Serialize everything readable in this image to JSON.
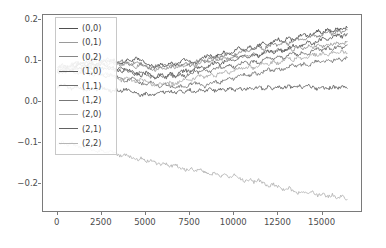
{
  "figure": {
    "background": "#ffffff",
    "axes_edge_color": "#7a7a7a",
    "tick_label_color": "#4d4d4d"
  },
  "legend": {
    "position": "upper left",
    "frame": true,
    "entries": [
      {
        "label": "(0,0)",
        "color": "#4f4f4f"
      },
      {
        "label": "(0,1)",
        "color": "#9a9a9a"
      },
      {
        "label": "(0,2)",
        "color": "#868686"
      },
      {
        "label": "(1,0)",
        "color": "#5a5a5a"
      },
      {
        "label": "(1,1)",
        "color": "#6e6e6e"
      },
      {
        "label": "(1,2)",
        "color": "#777777"
      },
      {
        "label": "(2,0)",
        "color": "#aeaeae"
      },
      {
        "label": "(2,1)",
        "color": "#626262"
      },
      {
        "label": "(2,2)",
        "color": "#b6b6b6"
      }
    ]
  },
  "chart_data": {
    "type": "line",
    "title": "",
    "xlabel": "",
    "ylabel": "",
    "grid": false,
    "legend_position": "upper left",
    "xlim": [
      -830,
      17290
    ],
    "ylim": [
      -0.272,
      0.212
    ],
    "xticks": [
      0,
      2500,
      5000,
      7500,
      10000,
      12500,
      15000
    ],
    "xtick_labels": [
      "0",
      "2500",
      "5000",
      "7500",
      "10000",
      "12500",
      "15000"
    ],
    "yticks": [
      0.2,
      0.1,
      0.0,
      -0.1,
      -0.2
    ],
    "ytick_labels": [
      "0.2",
      "0.1",
      "0.0",
      "-0.1",
      "-0.2"
    ],
    "x_start": 0,
    "x_end": 16500,
    "n_points": 60,
    "series": [
      {
        "name": "(0,0)",
        "color": "#4f4f4f",
        "values": [
          0.071,
          0.078,
          0.082,
          0.075,
          0.088,
          0.093,
          0.086,
          0.095,
          0.091,
          0.099,
          0.094,
          0.103,
          0.098,
          0.092,
          0.101,
          0.096,
          0.105,
          0.099,
          0.094,
          0.088,
          0.083,
          0.091,
          0.086,
          0.094,
          0.089,
          0.097,
          0.103,
          0.097,
          0.092,
          0.1,
          0.108,
          0.113,
          0.107,
          0.115,
          0.121,
          0.116,
          0.124,
          0.131,
          0.126,
          0.134,
          0.129,
          0.137,
          0.143,
          0.138,
          0.146,
          0.152,
          0.147,
          0.155,
          0.15,
          0.158,
          0.164,
          0.159,
          0.167,
          0.173,
          0.168,
          0.176,
          0.171,
          0.179,
          0.175,
          0.181
        ]
      },
      {
        "name": "(0,1)",
        "color": "#9a9a9a",
        "values": [
          0.074,
          0.069,
          0.078,
          0.084,
          0.079,
          0.087,
          0.082,
          0.09,
          0.085,
          0.093,
          0.088,
          0.096,
          0.091,
          0.086,
          0.094,
          0.089,
          0.083,
          0.091,
          0.086,
          0.08,
          0.075,
          0.083,
          0.078,
          0.086,
          0.081,
          0.089,
          0.084,
          0.092,
          0.087,
          0.095,
          0.101,
          0.096,
          0.104,
          0.099,
          0.107,
          0.102,
          0.11,
          0.105,
          0.113,
          0.108,
          0.116,
          0.111,
          0.119,
          0.124,
          0.119,
          0.127,
          0.122,
          0.13,
          0.125,
          0.133,
          0.128,
          0.136,
          0.131,
          0.139,
          0.134,
          0.142,
          0.137,
          0.145,
          0.14,
          0.147
        ]
      },
      {
        "name": "(0,2)",
        "color": "#868686",
        "values": [
          0.082,
          0.089,
          0.084,
          0.092,
          0.097,
          0.091,
          0.099,
          0.094,
          0.102,
          0.096,
          0.104,
          0.098,
          0.093,
          0.101,
          0.095,
          0.089,
          0.097,
          0.091,
          0.085,
          0.079,
          0.087,
          0.081,
          0.089,
          0.083,
          0.091,
          0.085,
          0.093,
          0.087,
          0.095,
          0.102,
          0.096,
          0.104,
          0.11,
          0.105,
          0.113,
          0.118,
          0.112,
          0.12,
          0.126,
          0.121,
          0.129,
          0.134,
          0.128,
          0.136,
          0.142,
          0.137,
          0.145,
          0.14,
          0.148,
          0.154,
          0.149,
          0.157,
          0.162,
          0.157,
          0.165,
          0.17,
          0.165,
          0.173,
          0.168,
          0.176
        ]
      },
      {
        "name": "(1,0)",
        "color": "#5a5a5a",
        "values": [
          0.068,
          0.075,
          0.07,
          0.078,
          0.083,
          0.077,
          0.085,
          0.08,
          0.088,
          0.082,
          0.076,
          0.084,
          0.078,
          0.072,
          0.08,
          0.074,
          0.068,
          0.062,
          0.07,
          0.064,
          0.058,
          0.066,
          0.06,
          0.068,
          0.062,
          0.07,
          0.076,
          0.071,
          0.079,
          0.085,
          0.08,
          0.088,
          0.094,
          0.089,
          0.097,
          0.103,
          0.098,
          0.106,
          0.112,
          0.107,
          0.115,
          0.11,
          0.118,
          0.124,
          0.119,
          0.127,
          0.122,
          0.13,
          0.136,
          0.131,
          0.139,
          0.145,
          0.14,
          0.148,
          0.154,
          0.149,
          0.157,
          0.163,
          0.158,
          0.166
        ]
      },
      {
        "name": "(1,1)",
        "color": "#6e6e6e",
        "values": [
          0.08,
          0.086,
          0.081,
          0.089,
          0.094,
          0.088,
          0.096,
          0.09,
          0.084,
          0.092,
          0.086,
          0.08,
          0.074,
          0.082,
          0.076,
          0.07,
          0.064,
          0.072,
          0.066,
          0.06,
          0.054,
          0.062,
          0.056,
          0.064,
          0.058,
          0.066,
          0.06,
          0.068,
          0.074,
          0.069,
          0.077,
          0.071,
          0.079,
          0.085,
          0.08,
          0.088,
          0.082,
          0.09,
          0.096,
          0.091,
          0.099,
          0.093,
          0.101,
          0.107,
          0.102,
          0.11,
          0.104,
          0.112,
          0.118,
          0.113,
          0.121,
          0.115,
          0.123,
          0.129,
          0.124,
          0.132,
          0.127,
          0.135,
          0.13,
          0.138
        ]
      },
      {
        "name": "(1,2)",
        "color": "#777777",
        "values": [
          0.076,
          0.07,
          0.078,
          0.072,
          0.066,
          0.074,
          0.068,
          0.062,
          0.07,
          0.064,
          0.058,
          0.066,
          0.06,
          0.054,
          0.048,
          0.056,
          0.05,
          0.044,
          0.038,
          0.046,
          0.04,
          0.034,
          0.042,
          0.036,
          0.03,
          0.038,
          0.032,
          0.04,
          0.046,
          0.041,
          0.035,
          0.043,
          0.049,
          0.044,
          0.052,
          0.058,
          0.053,
          0.061,
          0.067,
          0.062,
          0.07,
          0.064,
          0.072,
          0.078,
          0.073,
          0.081,
          0.075,
          0.083,
          0.089,
          0.084,
          0.092,
          0.086,
          0.094,
          0.1,
          0.095,
          0.103,
          0.097,
          0.105,
          0.099,
          0.107
        ]
      },
      {
        "name": "(2,0)",
        "color": "#aeaeae",
        "values": [
          0.073,
          0.08,
          0.074,
          0.082,
          0.076,
          0.07,
          0.078,
          0.072,
          0.066,
          0.06,
          0.068,
          0.062,
          0.056,
          0.05,
          0.058,
          0.052,
          0.046,
          0.054,
          0.048,
          0.042,
          0.036,
          0.044,
          0.038,
          0.046,
          0.04,
          0.048,
          0.054,
          0.049,
          0.057,
          0.063,
          0.058,
          0.066,
          0.06,
          0.068,
          0.074,
          0.069,
          0.077,
          0.083,
          0.078,
          0.086,
          0.08,
          0.088,
          0.094,
          0.089,
          0.097,
          0.091,
          0.099,
          0.105,
          0.1,
          0.108,
          0.102,
          0.11,
          0.116,
          0.111,
          0.119,
          0.113,
          0.121,
          0.115,
          0.123,
          0.117
        ]
      },
      {
        "name": "(2,1)",
        "color": "#626262",
        "values": [
          0.034,
          0.04,
          0.035,
          0.029,
          0.036,
          0.03,
          0.024,
          0.031,
          0.026,
          0.033,
          0.028,
          0.022,
          0.029,
          0.023,
          0.03,
          0.025,
          0.019,
          0.012,
          0.018,
          0.012,
          0.018,
          0.024,
          0.019,
          0.025,
          0.02,
          0.026,
          0.021,
          0.027,
          0.022,
          0.028,
          0.023,
          0.029,
          0.024,
          0.03,
          0.025,
          0.031,
          0.026,
          0.032,
          0.027,
          0.033,
          0.028,
          0.034,
          0.029,
          0.035,
          0.03,
          0.036,
          0.031,
          0.037,
          0.032,
          0.038,
          0.033,
          0.039,
          0.034,
          0.028,
          0.034,
          0.029,
          0.035,
          0.03,
          0.036,
          0.031
        ]
      },
      {
        "name": "(2,2)",
        "color": "#b6b6b6",
        "values": [
          -0.108,
          -0.102,
          -0.11,
          -0.104,
          -0.112,
          -0.118,
          -0.112,
          -0.12,
          -0.126,
          -0.121,
          -0.129,
          -0.124,
          -0.132,
          -0.138,
          -0.133,
          -0.141,
          -0.147,
          -0.142,
          -0.15,
          -0.145,
          -0.153,
          -0.159,
          -0.154,
          -0.162,
          -0.157,
          -0.165,
          -0.171,
          -0.166,
          -0.174,
          -0.169,
          -0.177,
          -0.183,
          -0.178,
          -0.186,
          -0.181,
          -0.189,
          -0.184,
          -0.192,
          -0.198,
          -0.193,
          -0.201,
          -0.196,
          -0.204,
          -0.21,
          -0.205,
          -0.213,
          -0.219,
          -0.214,
          -0.222,
          -0.228,
          -0.223,
          -0.231,
          -0.226,
          -0.234,
          -0.229,
          -0.237,
          -0.232,
          -0.24,
          -0.235,
          -0.243
        ]
      }
    ],
    "negative_series": [
      "(2,2)"
    ]
  }
}
